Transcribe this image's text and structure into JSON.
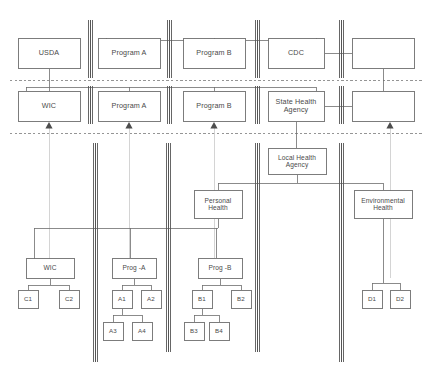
{
  "diagram": {
    "stroke_color": "#6e6e6e",
    "divider_color": "#555555",
    "faint_line_color": "#cfcfcf",
    "dashed_line_color": "#7a7a7a",
    "box_fill": "#ffffff",
    "text_color": "#4a4a4a"
  },
  "tier_federal": {
    "label": "federal tier",
    "nodes": [
      {
        "id": "usda",
        "text": "USDA",
        "x": 18,
        "y": 38,
        "w": 62,
        "h": 30
      },
      {
        "id": "program_a",
        "text": "Program A",
        "x": 98,
        "y": 38,
        "w": 62,
        "h": 30
      },
      {
        "id": "program_b",
        "text": "Program B",
        "x": 183,
        "y": 38,
        "w": 62,
        "h": 30
      },
      {
        "id": "cdc",
        "text": "CDC",
        "x": 268,
        "y": 38,
        "w": 56,
        "h": 30
      },
      {
        "id": "fed_blank",
        "text": "",
        "x": 352,
        "y": 38,
        "w": 62,
        "h": 30
      }
    ]
  },
  "tier_state": {
    "label": "state tier",
    "nodes": [
      {
        "id": "wic",
        "text": "WIC",
        "x": 18,
        "y": 91,
        "w": 62,
        "h": 30
      },
      {
        "id": "state_program_a",
        "text": "Program A",
        "x": 98,
        "y": 91,
        "w": 62,
        "h": 30
      },
      {
        "id": "state_program_b",
        "text": "Program B",
        "x": 183,
        "y": 91,
        "w": 62,
        "h": 30
      },
      {
        "id": "state_health_agency",
        "text": "State Health\nAgency",
        "x": 268,
        "y": 91,
        "w": 56,
        "h": 30
      },
      {
        "id": "state_blank",
        "text": "",
        "x": 352,
        "y": 91,
        "w": 62,
        "h": 30
      }
    ]
  },
  "tier_local": {
    "label": "local tier",
    "nodes": [
      {
        "id": "local_health_agency",
        "text": "Local Health\nAgency",
        "x": 268,
        "y": 148,
        "w": 58,
        "h": 26
      },
      {
        "id": "personal_health",
        "text": "Personal\nHealth",
        "x": 194,
        "y": 190,
        "w": 48,
        "h": 28
      },
      {
        "id": "environmental_health",
        "text": "Environmental\nHealth",
        "x": 354,
        "y": 190,
        "w": 58,
        "h": 28
      }
    ]
  },
  "tier_service": {
    "label": "service delivery tier",
    "clusters": [
      {
        "id": "cluster_wic",
        "parent": {
          "id": "svc_wic",
          "text": "WIC",
          "x": 26,
          "y": 258,
          "w": 48,
          "h": 20
        },
        "children": [
          {
            "id": "c1",
            "text": "C1",
            "x": 18,
            "y": 290,
            "w": 20,
            "h": 18
          },
          {
            "id": "c2",
            "text": "C2",
            "x": 59,
            "y": 290,
            "w": 20,
            "h": 18
          }
        ],
        "grandchildren": []
      },
      {
        "id": "cluster_prog_a",
        "parent": {
          "id": "svc_prog_a",
          "text": "Prog -A",
          "x": 112,
          "y": 258,
          "w": 44,
          "h": 20
        },
        "children": [
          {
            "id": "a1",
            "text": "A1",
            "x": 112,
            "y": 290,
            "w": 20,
            "h": 18
          },
          {
            "id": "a2",
            "text": "A2",
            "x": 141,
            "y": 290,
            "w": 20,
            "h": 18
          }
        ],
        "grandchildren": [
          {
            "id": "a3",
            "text": "A3",
            "x": 103,
            "y": 322,
            "w": 20,
            "h": 18
          },
          {
            "id": "a4",
            "text": "A4",
            "x": 132,
            "y": 322,
            "w": 20,
            "h": 18
          }
        ]
      },
      {
        "id": "cluster_prog_b",
        "parent": {
          "id": "svc_prog_b",
          "text": "Prog -B",
          "x": 198,
          "y": 258,
          "w": 44,
          "h": 20
        },
        "children": [
          {
            "id": "b1",
            "text": "B1",
            "x": 192,
            "y": 290,
            "w": 20,
            "h": 18
          },
          {
            "id": "b2",
            "text": "B2",
            "x": 231,
            "y": 290,
            "w": 20,
            "h": 18
          }
        ],
        "grandchildren": [
          {
            "id": "b3",
            "text": "B3",
            "x": 184,
            "y": 322,
            "w": 20,
            "h": 18
          },
          {
            "id": "b4",
            "text": "B4",
            "x": 209,
            "y": 322,
            "w": 20,
            "h": 18
          }
        ]
      },
      {
        "id": "cluster_env",
        "parent": null,
        "children": [
          {
            "id": "d1",
            "text": "D1",
            "x": 362,
            "y": 290,
            "w": 20,
            "h": 18
          },
          {
            "id": "d2",
            "text": "D2",
            "x": 390,
            "y": 290,
            "w": 20,
            "h": 18
          }
        ],
        "grandchildren": []
      }
    ]
  },
  "dividers": {
    "label": "vertical double-line separators",
    "top_segments": [
      {
        "id": "divider-top-1",
        "x": 90,
        "y1": 20,
        "y2": 78
      },
      {
        "id": "divider-top-2",
        "x": 169,
        "y1": 20,
        "y2": 78
      },
      {
        "id": "divider-top-3",
        "x": 257,
        "y1": 20,
        "y2": 78
      },
      {
        "id": "divider-top-4",
        "x": 341,
        "y1": 20,
        "y2": 78
      }
    ],
    "mid_segments": [
      {
        "id": "divider-mid-1",
        "x": 90,
        "y1": 86,
        "y2": 124
      },
      {
        "id": "divider-mid-2",
        "x": 169,
        "y1": 86,
        "y2": 124
      },
      {
        "id": "divider-mid-3",
        "x": 257,
        "y1": 86,
        "y2": 124
      },
      {
        "id": "divider-mid-4",
        "x": 341,
        "y1": 86,
        "y2": 124
      }
    ],
    "bottom_segments": [
      {
        "id": "divider-bot-1",
        "x": 95,
        "y1": 143,
        "y2": 362
      },
      {
        "id": "divider-bot-2",
        "x": 168,
        "y1": 143,
        "y2": 352
      },
      {
        "id": "divider-bot-3",
        "x": 257,
        "y1": 143,
        "y2": 352
      },
      {
        "id": "divider-bot-4",
        "x": 341,
        "y1": 143,
        "y2": 362
      }
    ]
  },
  "dashed_rules": {
    "label": "horizontal tier boundary rules",
    "lines": [
      {
        "id": "dashed-rule-federal-state",
        "y": 80,
        "x1": 10,
        "x2": 424
      },
      {
        "id": "dashed-rule-state-local",
        "y": 133,
        "x1": 10,
        "x2": 424
      }
    ]
  },
  "arrows": {
    "label": "upward flow arrowheads crossing tier boundary",
    "positions": [
      {
        "id": "arrow-wic",
        "x": 49
      },
      {
        "id": "arrow-program-a",
        "x": 129
      },
      {
        "id": "arrow-program-b",
        "x": 214
      },
      {
        "id": "arrow-right",
        "x": 390
      }
    ],
    "y": 128
  }
}
